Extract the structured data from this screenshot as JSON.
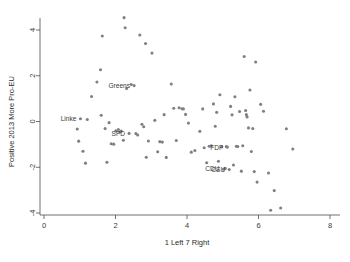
{
  "chart_data": {
    "type": "scatter",
    "title": "",
    "xlabel": "1 Left 7 Right",
    "ylabel": "Positive 2013 More Pro-EU",
    "xlim": [
      0,
      8
    ],
    "ylim": [
      -4,
      4
    ],
    "xticks": [
      0,
      2,
      4,
      6,
      8
    ],
    "yticks": [
      -4,
      -2,
      0,
      2,
      4
    ],
    "xtick_labels": [
      "0",
      "2",
      "4",
      "6",
      "8"
    ],
    "ytick_labels": [
      "-4",
      "-2",
      "0",
      "2",
      "4"
    ],
    "grid": false,
    "legend": null,
    "marker_color": "#808080",
    "marker_size": 3.1,
    "series": [
      {
        "name": "parties",
        "points": [
          {
            "x": 0.93,
            "y": -0.33
          },
          {
            "x": 0.97,
            "y": -0.86
          },
          {
            "x": 1.02,
            "y": 0.12,
            "label": "Linke"
          },
          {
            "x": 1.09,
            "y": -1.3
          },
          {
            "x": 1.16,
            "y": -1.82
          },
          {
            "x": 1.21,
            "y": 0.09
          },
          {
            "x": 1.33,
            "y": 1.09
          },
          {
            "x": 1.48,
            "y": 1.73
          },
          {
            "x": 1.58,
            "y": 2.26
          },
          {
            "x": 1.6,
            "y": 0.27
          },
          {
            "x": 1.63,
            "y": 3.74
          },
          {
            "x": 1.71,
            "y": -0.31
          },
          {
            "x": 1.76,
            "y": -1.78
          },
          {
            "x": 1.82,
            "y": -0.05
          },
          {
            "x": 1.88,
            "y": -0.97
          },
          {
            "x": 1.95,
            "y": -0.99
          },
          {
            "x": 2.01,
            "y": -0.41
          },
          {
            "x": 2.08,
            "y": -0.35
          },
          {
            "x": 2.12,
            "y": -0.46
          },
          {
            "x": 2.16,
            "y": -0.42
          },
          {
            "x": 2.22,
            "y": -0.82
          },
          {
            "x": 2.24,
            "y": 4.54
          },
          {
            "x": 2.27,
            "y": 4.1
          },
          {
            "x": 2.31,
            "y": 1.44
          },
          {
            "x": 2.38,
            "y": -0.52,
            "label": "SPD"
          },
          {
            "x": 2.44,
            "y": 1.62
          },
          {
            "x": 2.52,
            "y": 1.57
          },
          {
            "x": 2.57,
            "y": -0.53
          },
          {
            "x": 2.62,
            "y": -0.59
          },
          {
            "x": 2.68,
            "y": 3.78
          },
          {
            "x": 2.74,
            "y": -0.12
          },
          {
            "x": 2.79,
            "y": -0.23
          },
          {
            "x": 2.84,
            "y": 3.41
          },
          {
            "x": 2.86,
            "y": -1.56
          },
          {
            "x": 2.92,
            "y": -0.85
          },
          {
            "x": 3.02,
            "y": 2.99
          },
          {
            "x": 3.1,
            "y": 0.05
          },
          {
            "x": 3.18,
            "y": -1.32
          },
          {
            "x": 3.24,
            "y": -0.88
          },
          {
            "x": 3.31,
            "y": -0.9
          },
          {
            "x": 3.36,
            "y": 0.3
          },
          {
            "x": 3.42,
            "y": -1.57
          },
          {
            "x": 3.56,
            "y": 1.64
          },
          {
            "x": 3.63,
            "y": 0.58
          },
          {
            "x": 3.7,
            "y": -0.83
          },
          {
            "x": 3.78,
            "y": 0.6
          },
          {
            "x": 3.86,
            "y": 0.56
          },
          {
            "x": 3.9,
            "y": 0.55
          },
          {
            "x": 3.96,
            "y": 0.31
          },
          {
            "x": 4.04,
            "y": -0.07
          },
          {
            "x": 4.12,
            "y": -1.34
          },
          {
            "x": 4.22,
            "y": -1.27
          },
          {
            "x": 4.36,
            "y": -0.43
          },
          {
            "x": 4.44,
            "y": 0.55
          },
          {
            "x": 4.48,
            "y": -1.15
          },
          {
            "x": 4.55,
            "y": -1.8
          },
          {
            "x": 4.62,
            "y": -1.08
          },
          {
            "x": 4.68,
            "y": -1.06
          },
          {
            "x": 4.74,
            "y": 0.77
          },
          {
            "x": 4.79,
            "y": -0.21
          },
          {
            "x": 4.83,
            "y": 0.4
          },
          {
            "x": 4.88,
            "y": -1.74
          },
          {
            "x": 4.92,
            "y": 1.17
          },
          {
            "x": 4.97,
            "y": -1.11
          },
          {
            "x": 5.02,
            "y": -2.08,
            "label": "CDU"
          },
          {
            "x": 5.07,
            "y": -2.05
          },
          {
            "x": 5.1,
            "y": -1.1
          },
          {
            "x": 5.13,
            "y": -1.12,
            "label": "FDP"
          },
          {
            "x": 5.18,
            "y": -2.1,
            "label": "CSU"
          },
          {
            "x": 5.22,
            "y": 0.66
          },
          {
            "x": 5.26,
            "y": 0.29
          },
          {
            "x": 5.3,
            "y": -1.9
          },
          {
            "x": 5.34,
            "y": 1.08
          },
          {
            "x": 5.38,
            "y": -1.08
          },
          {
            "x": 5.42,
            "y": -1.09
          },
          {
            "x": 5.47,
            "y": 0.44
          },
          {
            "x": 5.52,
            "y": -2.17
          },
          {
            "x": 5.56,
            "y": -1.06
          },
          {
            "x": 5.6,
            "y": 2.84
          },
          {
            "x": 5.64,
            "y": 0.48
          },
          {
            "x": 5.66,
            "y": 0.3
          },
          {
            "x": 5.68,
            "y": 0.2
          },
          {
            "x": 5.72,
            "y": -0.28
          },
          {
            "x": 5.76,
            "y": 1.38
          },
          {
            "x": 5.8,
            "y": -1.31
          },
          {
            "x": 5.84,
            "y": -0.31
          },
          {
            "x": 5.88,
            "y": -2.19
          },
          {
            "x": 5.92,
            "y": 2.6
          },
          {
            "x": 5.96,
            "y": -2.65
          },
          {
            "x": 6.06,
            "y": 0.75
          },
          {
            "x": 6.14,
            "y": 0.45
          },
          {
            "x": 6.28,
            "y": -2.25
          },
          {
            "x": 6.34,
            "y": -3.88
          },
          {
            "x": 6.44,
            "y": -3.02
          },
          {
            "x": 6.62,
            "y": -3.78
          },
          {
            "x": 6.78,
            "y": -0.32
          },
          {
            "x": 6.96,
            "y": -1.2
          }
        ]
      }
    ],
    "point_labels": [
      {
        "text": "Linke",
        "x": 1.02,
        "y": 0.12
      },
      {
        "text": "Greens",
        "x": 2.52,
        "y": 1.57
      },
      {
        "text": "SPD",
        "x": 2.38,
        "y": -0.52
      },
      {
        "text": "FDP",
        "x": 5.13,
        "y": -1.12
      },
      {
        "text": "CDU",
        "x": 5.02,
        "y": -2.08
      },
      {
        "text": "CSU",
        "x": 5.18,
        "y": -2.1
      }
    ]
  }
}
